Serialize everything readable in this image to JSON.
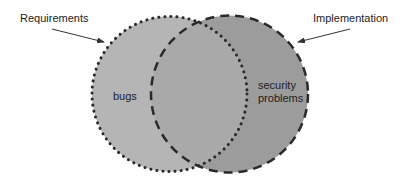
{
  "diagram": {
    "type": "venn",
    "sets": [
      {
        "name": "Requirements",
        "border": "dotted",
        "fill": "#b3b3b3"
      },
      {
        "name": "Implementation",
        "border": "dashed",
        "fill": "#9a9a9a"
      }
    ],
    "overlap_fill": "#a8a8a8",
    "labels": {
      "requirements": "Requirements",
      "implementation": "Implementation",
      "bugs": "bugs",
      "security_line1": "security",
      "security_line2": "problems"
    }
  }
}
